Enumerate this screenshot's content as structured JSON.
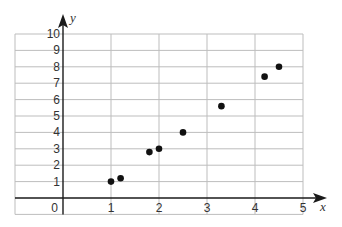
{
  "chart_data": {
    "type": "scatter",
    "title": "",
    "xlabel": "x",
    "ylabel": "y",
    "xlim": [
      -1,
      5
    ],
    "ylim": [
      -1,
      10
    ],
    "grid": true,
    "legend": null,
    "x_ticks": [
      "0",
      "1",
      "2",
      "3",
      "4",
      "5"
    ],
    "y_ticks": [
      "1",
      "2",
      "3",
      "4",
      "5",
      "6",
      "7",
      "8",
      "9",
      "10"
    ],
    "points": [
      {
        "x": 1.0,
        "y": 1.0
      },
      {
        "x": 1.2,
        "y": 1.2
      },
      {
        "x": 1.8,
        "y": 2.8
      },
      {
        "x": 2.0,
        "y": 3.0
      },
      {
        "x": 2.5,
        "y": 4.0
      },
      {
        "x": 3.3,
        "y": 5.6
      },
      {
        "x": 4.2,
        "y": 7.4
      },
      {
        "x": 4.5,
        "y": 8.0
      }
    ],
    "colors": {
      "grid": "#bdbdbd",
      "axis": "#1a1a1a",
      "point": "#111111",
      "text": "#333333"
    }
  }
}
